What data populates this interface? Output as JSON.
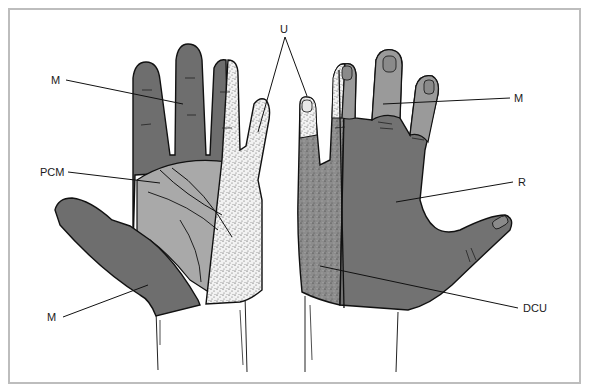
{
  "figure": {
    "type": "anatomical diagram",
    "colors": {
      "border": "#bdbdbd",
      "median_dark": "#6e6e6e",
      "median_light_dorsal": "#9a9a9a",
      "palmar_cutaneous_median": "#a9a9a9",
      "ulnar_stipple_bg": "#f0f0f0",
      "dorsal_ulnar_stipple_bg": "#8a8a8a",
      "radial": "#727272",
      "outline": "#111111"
    }
  },
  "labels": {
    "m_top_left": "M",
    "pcm": "PCM",
    "m_bottom_left": "M",
    "u": "U",
    "m_top_right": "M",
    "r": "R",
    "dcu": "DCU"
  },
  "views": {
    "left": "palmar",
    "right": "dorsal"
  }
}
